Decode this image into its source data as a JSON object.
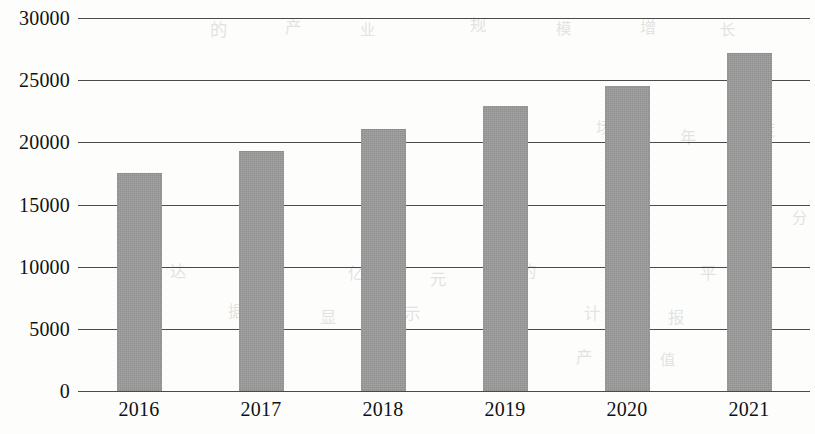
{
  "chart_data": {
    "type": "bar",
    "title": "",
    "subtitle": "",
    "xlabel": "",
    "ylabel": "",
    "categories": [
      "2016",
      "2017",
      "2018",
      "2019",
      "2020",
      "2021"
    ],
    "values": [
      17500,
      19300,
      21100,
      22900,
      24500,
      27200
    ],
    "series": [
      {
        "name": "",
        "values": [
          17500,
          19300,
          21100,
          22900,
          24500,
          27200
        ]
      }
    ],
    "ylim": [
      0,
      30000
    ],
    "ytick_labels": [
      "0",
      "5000",
      "10000",
      "15000",
      "20000",
      "25000",
      "30000"
    ],
    "ytick_values": [
      0,
      5000,
      10000,
      15000,
      20000,
      25000,
      30000
    ],
    "grid": true,
    "grid_axis": "y",
    "legend": false,
    "legend_position": "none",
    "annotations": [],
    "bar_color": "#9b9b9b",
    "axis_color": "#4a4a4a",
    "text_color": "#111111",
    "background_color": "#fdfdfc"
  },
  "scan_artifacts": {
    "description": "faint reverse-side show-through from scanned page",
    "marks": [
      {
        "text": "的",
        "x": 210,
        "y": 16,
        "size": 17
      },
      {
        "text": "产",
        "x": 285,
        "y": 14,
        "size": 16
      },
      {
        "text": "业",
        "x": 360,
        "y": 18,
        "size": 15
      },
      {
        "text": "规",
        "x": 470,
        "y": 12,
        "size": 16
      },
      {
        "text": "模",
        "x": 556,
        "y": 17,
        "size": 15
      },
      {
        "text": "增",
        "x": 640,
        "y": 14,
        "size": 16
      },
      {
        "text": "长",
        "x": 720,
        "y": 18,
        "size": 15
      },
      {
        "text": "市",
        "x": 505,
        "y": 120,
        "size": 16
      },
      {
        "text": "场",
        "x": 596,
        "y": 116,
        "size": 15
      },
      {
        "text": "年",
        "x": 680,
        "y": 124,
        "size": 16
      },
      {
        "text": "度",
        "x": 760,
        "y": 118,
        "size": 15
      },
      {
        "text": "分",
        "x": 792,
        "y": 206,
        "size": 15
      },
      {
        "text": "个",
        "x": 118,
        "y": 262,
        "size": 18
      },
      {
        "text": "达",
        "x": 170,
        "y": 258,
        "size": 16
      },
      {
        "text": "到",
        "x": 262,
        "y": 264,
        "size": 16
      },
      {
        "text": "亿",
        "x": 348,
        "y": 260,
        "size": 16
      },
      {
        "text": "元",
        "x": 430,
        "y": 266,
        "size": 16
      },
      {
        "text": "的",
        "x": 520,
        "y": 258,
        "size": 16
      },
      {
        "text": "水",
        "x": 610,
        "y": 264,
        "size": 16
      },
      {
        "text": "平",
        "x": 700,
        "y": 260,
        "size": 16
      },
      {
        "text": "数",
        "x": 140,
        "y": 302,
        "size": 17
      },
      {
        "text": "据",
        "x": 228,
        "y": 298,
        "size": 16
      },
      {
        "text": "显",
        "x": 320,
        "y": 304,
        "size": 16
      },
      {
        "text": "示",
        "x": 404,
        "y": 300,
        "size": 16
      },
      {
        "text": "统",
        "x": 496,
        "y": 306,
        "size": 16
      },
      {
        "text": "计",
        "x": 584,
        "y": 300,
        "size": 16
      },
      {
        "text": "报",
        "x": 668,
        "y": 304,
        "size": 16
      },
      {
        "text": "告",
        "x": 752,
        "y": 300,
        "size": 16
      },
      {
        "text": "产",
        "x": 576,
        "y": 344,
        "size": 16
      },
      {
        "text": "值",
        "x": 660,
        "y": 348,
        "size": 15
      },
      {
        "text": "总",
        "x": 744,
        "y": 344,
        "size": 15
      }
    ]
  }
}
